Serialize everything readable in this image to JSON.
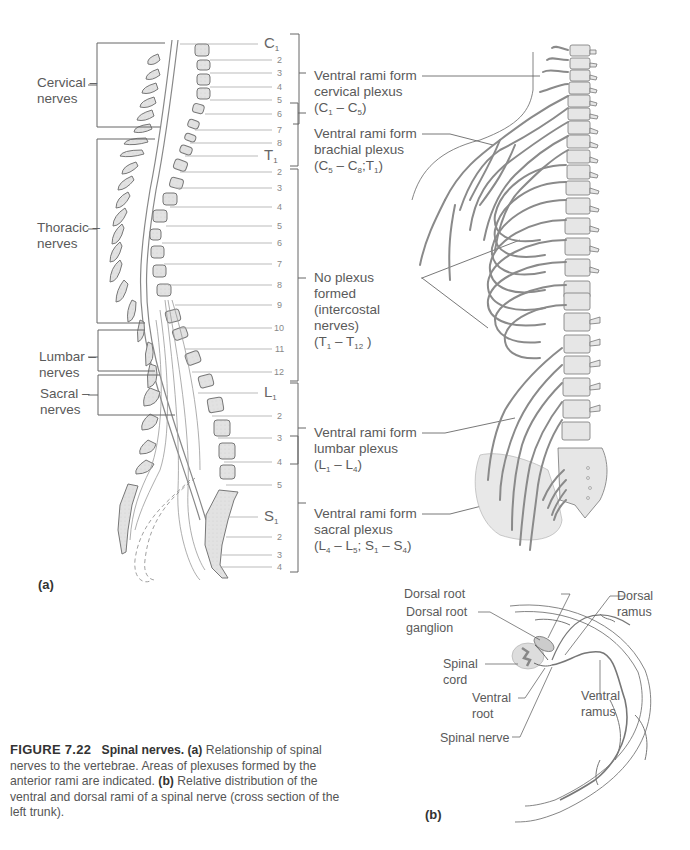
{
  "figure": {
    "number": "FIGURE 7.22",
    "title": "Spinal nerves.",
    "caption_a_tag": "(a)",
    "caption_a_text": "Relationship of spinal nerves to the vertebrae. Areas of plexuses formed by the anterior rami are indicated.",
    "caption_b_tag": "(b)",
    "caption_b_text": "Relative distribution of the ventral and dorsal rami of a spinal nerve (cross section of the left trunk)."
  },
  "panel_a": {
    "label": "(a)",
    "groups": [
      {
        "name": "Cervical",
        "line2": "nerves"
      },
      {
        "name": "Thoracic",
        "line2": "nerves"
      },
      {
        "name": "Lumbar",
        "line2": "nerves"
      },
      {
        "name": "Sacral",
        "line2": "nerves"
      }
    ],
    "nerve_levels": {
      "cervical": [
        "C1",
        "2",
        "3",
        "4",
        "5",
        "6",
        "7",
        "8"
      ],
      "thoracic": [
        "T1",
        "2",
        "3",
        "4",
        "5",
        "6",
        "7",
        "8",
        "9",
        "10",
        "11",
        "12"
      ],
      "lumbar": [
        "L1",
        "2",
        "3",
        "4",
        "5"
      ],
      "sacral": [
        "S1",
        "2",
        "3",
        "4"
      ]
    },
    "plexuses": [
      {
        "line1": "Ventral rami form",
        "line2": "cervical plexus",
        "range": "(C1 – C5)"
      },
      {
        "line1": "Ventral rami form",
        "line2": "brachial plexus",
        "range": "(C5 – C8;T1)"
      },
      {
        "line1": "No plexus",
        "line2": "formed",
        "line3": "(intercostal",
        "line4": "nerves)",
        "range": "(T1 – T12 )"
      },
      {
        "line1": "Ventral rami form",
        "line2": "lumbar plexus",
        "range": "(L1 – L4)"
      },
      {
        "line1": "Ventral rami form",
        "line2": "sacral plexus",
        "range": "(L4 – L5; S1 – S4)"
      }
    ]
  },
  "panel_b": {
    "label": "(b)",
    "labels": {
      "dorsal_root": "Dorsal root",
      "dorsal_root_ganglion_1": "Dorsal root",
      "dorsal_root_ganglion_2": "ganglion",
      "spinal_cord_1": "Spinal",
      "spinal_cord_2": "cord",
      "ventral_root_1": "Ventral",
      "ventral_root_2": "root",
      "spinal_nerve": "Spinal nerve",
      "dorsal_ramus_1": "Dorsal",
      "dorsal_ramus_2": "ramus",
      "ventral_ramus_1": "Ventral",
      "ventral_ramus_2": "ramus"
    }
  },
  "colors": {
    "bone_fill": "#e4e4e4",
    "line": "#777777",
    "nerve": "#8a8a8a",
    "text": "#5a5a5a"
  }
}
